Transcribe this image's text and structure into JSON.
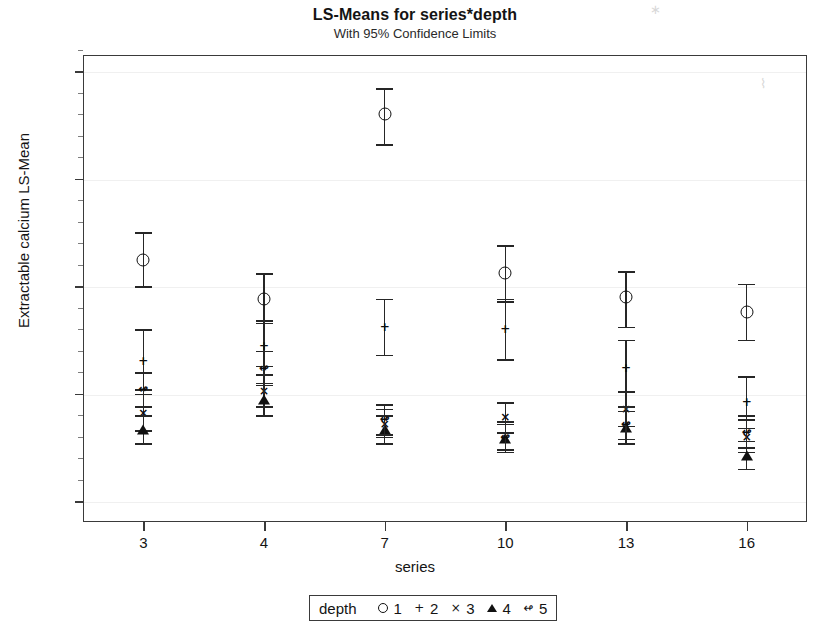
{
  "chart_data": {
    "type": "scatter",
    "title": "LS-Means for series*depth",
    "subtitle": "With 95% Confidence Limits",
    "xlabel": "series",
    "ylabel": "Extractable calcium LS-Mean",
    "categories": [
      "3",
      "4",
      "7",
      "10",
      "13",
      "16"
    ],
    "ylim": [
      0,
      210
    ],
    "yticks": [
      0,
      50,
      100,
      150,
      200
    ],
    "grid": true,
    "legend": {
      "title": "depth",
      "position": "bottom",
      "entries": [
        {
          "label": "1",
          "symbol": "circle"
        },
        {
          "label": "2",
          "symbol": "plus"
        },
        {
          "label": "3",
          "symbol": "times"
        },
        {
          "label": "4",
          "symbol": "triangle"
        },
        {
          "label": "5",
          "symbol": "five"
        }
      ]
    },
    "series": [
      {
        "name": "1",
        "symbol": "circle",
        "values": [
          112,
          94,
          180,
          106,
          95,
          88
        ],
        "lower": [
          100,
          83,
          166,
          93,
          81,
          75
        ],
        "upper": [
          125,
          106,
          192,
          119,
          107,
          101
        ]
      },
      {
        "name": "2",
        "symbol": "plus",
        "values": [
          65,
          72,
          81,
          80,
          62,
          46
        ],
        "lower": [
          52,
          63,
          68,
          66,
          51,
          34
        ],
        "upper": [
          80,
          84,
          94,
          94,
          75,
          58
        ]
      },
      {
        "name": "3",
        "symbol": "times",
        "values": [
          41,
          51,
          36,
          39,
          43,
          30
        ],
        "lower": [
          33,
          44,
          30,
          32,
          35,
          23
        ],
        "upper": [
          50,
          59,
          43,
          46,
          51,
          38
        ]
      },
      {
        "name": "4",
        "symbol": "triangle",
        "values": [
          33,
          47,
          33,
          29,
          34,
          21
        ],
        "lower": [
          27,
          40,
          27,
          23,
          27,
          15
        ],
        "upper": [
          40,
          55,
          40,
          36,
          42,
          28
        ]
      },
      {
        "name": "5",
        "symbol": "five",
        "values": [
          52,
          62,
          38,
          30,
          36,
          32
        ],
        "lower": [
          44,
          54,
          31,
          24,
          29,
          25
        ],
        "upper": [
          60,
          70,
          45,
          37,
          44,
          40
        ]
      }
    ]
  }
}
